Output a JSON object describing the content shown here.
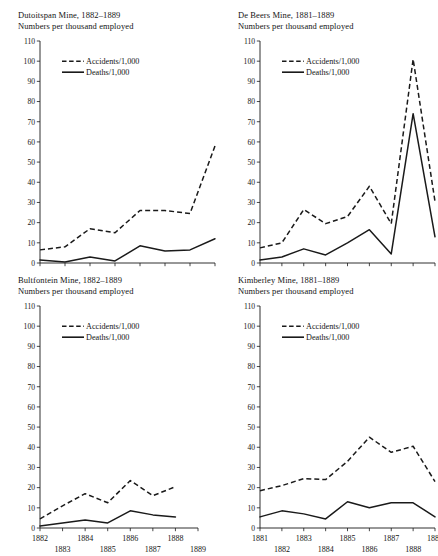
{
  "figure": {
    "legend": {
      "accidents_label": "Accidents/1,000",
      "deaths_label": "Deaths/1,000"
    },
    "subtitle_text": "Numbers per thousand employed",
    "y_ticks": [
      "0",
      "10",
      "20",
      "30",
      "40",
      "50",
      "60",
      "70",
      "80",
      "90",
      "100",
      "110"
    ],
    "ink_color": "#1a1a1a"
  },
  "chart_data": [
    {
      "type": "line",
      "title": "Dutoitspan Mine, 1882–1889",
      "subtitle": "Numbers per thousand employed",
      "xlabel": "",
      "ylabel": "Numbers per thousand employed",
      "categories": [
        "1882",
        "1883",
        "1884",
        "1885",
        "1886",
        "1887",
        "1888",
        "1889"
      ],
      "x_tick_labels": [
        "1882",
        "1883",
        "1884",
        "1885",
        "1886",
        "1887",
        "1888",
        "1889"
      ],
      "ylim": [
        0,
        110
      ],
      "y_ticks": [
        0,
        10,
        20,
        30,
        40,
        50,
        60,
        70,
        80,
        90,
        100,
        110
      ],
      "grid": false,
      "legend_position": "top-left",
      "series": [
        {
          "name": "Accidents/1,000",
          "style": "dashed",
          "values": [
            6.5,
            8.0,
            17.0,
            15.0,
            26.0,
            26.0,
            24.5,
            58.0
          ]
        },
        {
          "name": "Deaths/1,000",
          "style": "solid",
          "values": [
            1.5,
            0.5,
            3.0,
            1.0,
            8.5,
            6.0,
            6.5,
            12.0
          ]
        }
      ]
    },
    {
      "type": "line",
      "title": "De Beers Mine, 1881–1889",
      "subtitle": "Numbers per thousand employed",
      "xlabel": "",
      "ylabel": "Numbers per thousand employed",
      "categories": [
        "1881",
        "1882",
        "1883",
        "1884",
        "1885",
        "1886",
        "1887",
        "1888",
        "1889"
      ],
      "x_tick_labels": [
        "1881",
        "1882",
        "1883",
        "1884",
        "1885",
        "1886",
        "1887",
        "1888",
        "1889"
      ],
      "ylim": [
        0,
        110
      ],
      "y_ticks": [
        0,
        10,
        20,
        30,
        40,
        50,
        60,
        70,
        80,
        90,
        100,
        110
      ],
      "grid": false,
      "legend_position": "top-left",
      "series": [
        {
          "name": "Accidents/1,000",
          "style": "dashed",
          "values": [
            7.5,
            10.0,
            26.5,
            19.5,
            23.0,
            38.0,
            19.5,
            101.0,
            30.5
          ]
        },
        {
          "name": "Deaths/1,000",
          "style": "solid",
          "values": [
            1.5,
            3.0,
            7.0,
            4.0,
            10.0,
            16.5,
            4.5,
            74.0,
            13.0
          ]
        }
      ]
    },
    {
      "type": "line",
      "title": "Bultfontein Mine, 1882–1889",
      "subtitle": "Numbers per thousand employed",
      "xlabel": "",
      "ylabel": "Numbers per thousand employed",
      "categories": [
        "1882",
        "1883",
        "1884",
        "1885",
        "1886",
        "1887",
        "1888",
        "1889"
      ],
      "x_tick_labels": [
        "1882",
        "1883",
        "1884",
        "1885",
        "1886",
        "1887",
        "1888",
        "1889"
      ],
      "ylim": [
        0,
        110
      ],
      "y_ticks": [
        0,
        10,
        20,
        30,
        40,
        50,
        60,
        70,
        80,
        90,
        100,
        110
      ],
      "grid": false,
      "legend_position": "top-left",
      "series": [
        {
          "name": "Accidents/1,000",
          "style": "dashed",
          "values": [
            4.5,
            11.0,
            17.0,
            12.5,
            23.5,
            16.0,
            20.5
          ]
        },
        {
          "name": "Deaths/1,000",
          "style": "solid",
          "values": [
            1.0,
            2.5,
            4.0,
            2.5,
            8.5,
            6.5,
            5.5
          ]
        }
      ]
    },
    {
      "type": "line",
      "title": "Kimberley Mine, 1881–1889",
      "subtitle": "Numbers per thousand employed",
      "xlabel": "",
      "ylabel": "Numbers per thousand employed",
      "categories": [
        "1881",
        "1882",
        "1883",
        "1884",
        "1885",
        "1886",
        "1887",
        "1888",
        "1889"
      ],
      "x_tick_labels": [
        "1881",
        "1882",
        "1883",
        "1884",
        "1885",
        "1886",
        "1887",
        "1888",
        "1889"
      ],
      "ylim": [
        0,
        110
      ],
      "y_ticks": [
        0,
        10,
        20,
        30,
        40,
        50,
        60,
        70,
        80,
        90,
        100,
        110
      ],
      "grid": false,
      "legend_position": "top-left",
      "series": [
        {
          "name": "Accidents/1,000",
          "style": "dashed",
          "values": [
            18.5,
            21.0,
            24.5,
            24.0,
            33.0,
            45.0,
            37.5,
            40.5,
            23.0
          ]
        },
        {
          "name": "Deaths/1,000",
          "style": "solid",
          "values": [
            5.5,
            8.5,
            7.0,
            4.5,
            13.0,
            10.0,
            12.5,
            12.5,
            5.5
          ]
        }
      ]
    }
  ]
}
